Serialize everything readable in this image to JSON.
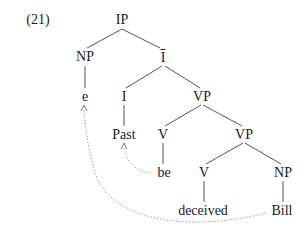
{
  "example_number": "(21)",
  "tree": {
    "root": "IP",
    "nodes": {
      "ip": "IP",
      "np_subj": "NP",
      "e": "e",
      "ibar": "I",
      "i": "I",
      "past": "Past",
      "vp_upper": "VP",
      "v_be": "V",
      "be": "be",
      "vp_lower": "VP",
      "v_deceived": "V",
      "deceived": "deceived",
      "np_obj": "NP",
      "bill": "Bill"
    },
    "movements": [
      {
        "from": "be",
        "to": "Past",
        "style": "dotted-arrow"
      },
      {
        "from": "Bill",
        "to": "e",
        "style": "dotted-arrow"
      }
    ]
  },
  "colors": {
    "line": "#555555",
    "dotted": "#8a8a8a",
    "text": "#1a1a1a"
  }
}
